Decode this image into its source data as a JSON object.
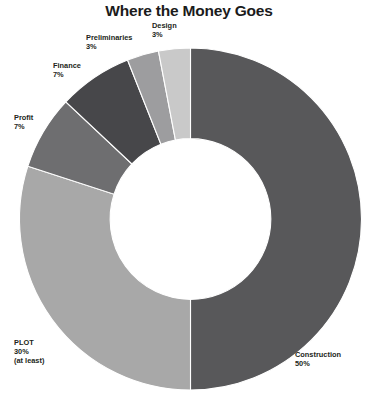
{
  "chart_data": {
    "type": "pie",
    "variant": "donut",
    "title": "Where the Money Goes",
    "xlabel": "",
    "ylabel": "",
    "units": "percent",
    "legend": "none",
    "grid": false,
    "start_angle_deg": 0,
    "direction": "clockwise",
    "inner_radius_ratio": 0.47,
    "categories": [
      "Construction",
      "PLOT",
      "Profit",
      "Finance",
      "Preliminaries",
      "Design"
    ],
    "values": [
      50,
      30,
      7,
      7,
      3,
      3
    ],
    "slices": [
      {
        "name": "Construction",
        "label": "Construction",
        "value": 50,
        "value_text": "50%",
        "note": "",
        "color": "#58585a"
      },
      {
        "name": "PLOT",
        "label": "PLOT",
        "value": 30,
        "value_text": "30%",
        "note": "(at least)",
        "color": "#a8a8a8"
      },
      {
        "name": "Profit",
        "label": "Profit",
        "value": 7,
        "value_text": "7%",
        "note": "",
        "color": "#6e6e70"
      },
      {
        "name": "Finance",
        "label": "Finance",
        "value": 7,
        "value_text": "7%",
        "note": "",
        "color": "#47474a"
      },
      {
        "name": "Preliminaries",
        "label": "Preliminaries",
        "value": 3,
        "value_text": "3%",
        "note": "",
        "color": "#9d9d9f"
      },
      {
        "name": "Design",
        "label": "Design",
        "value": 3,
        "value_text": "3%",
        "note": "",
        "color": "#c9c9c9"
      }
    ],
    "annotations": [
      {
        "name": "design-label",
        "text": "Design\n3%"
      },
      {
        "name": "preliminaries-label",
        "text": "Preliminaries\n3%"
      },
      {
        "name": "finance-label",
        "text": "Finance\n7%"
      },
      {
        "name": "profit-label",
        "text": "Profit\n7%"
      },
      {
        "name": "plot-label",
        "text": "PLOT\n30%\n(at least)"
      },
      {
        "name": "construction-label",
        "text": "Construction\n50%"
      }
    ],
    "colors": {
      "background": "#ffffff",
      "text": "#231f20",
      "title": "#1b1b1b"
    }
  }
}
